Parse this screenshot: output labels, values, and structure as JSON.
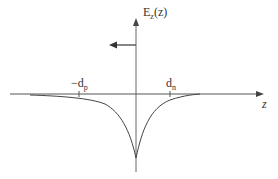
{
  "diagram": {
    "y_axis_label": "E",
    "y_axis_label_sub": "z",
    "y_axis_label_arg": "(z)",
    "x_axis_label": "z",
    "tick_left_label": "−d",
    "tick_left_sub": "p",
    "tick_right_label": "d",
    "tick_right_sub": "n",
    "colors": {
      "line": "#555555",
      "text": "#333333"
    }
  }
}
